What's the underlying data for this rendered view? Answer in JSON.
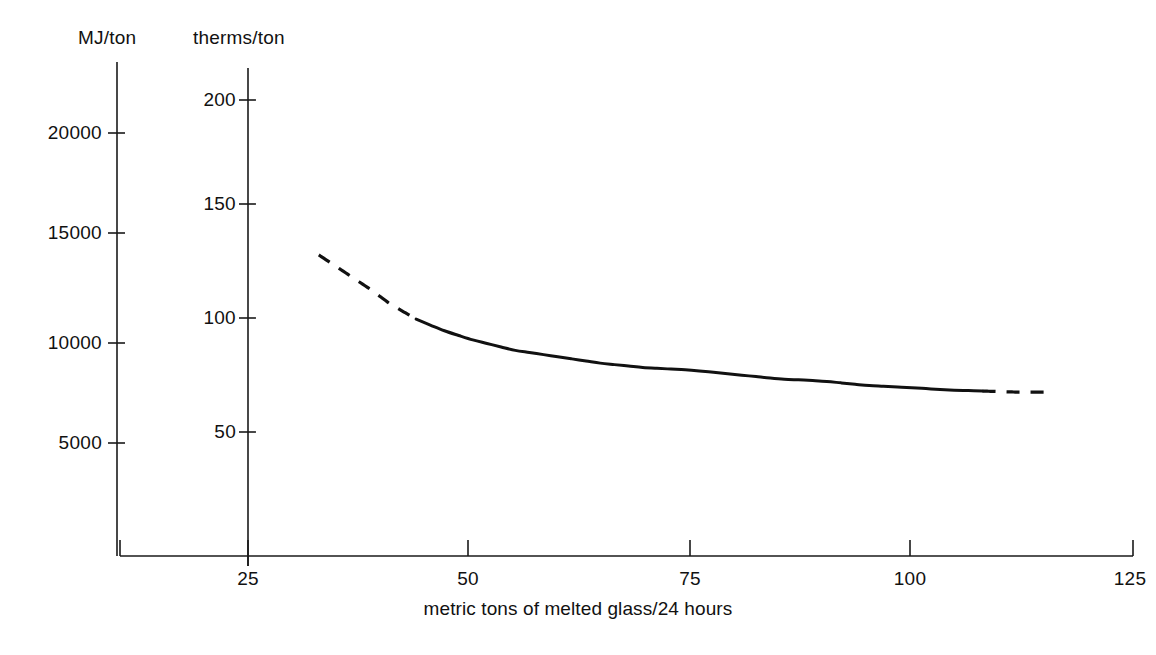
{
  "chart_data": {
    "type": "line",
    "title": "",
    "xlabel": "metric tons of melted glass/24 hours",
    "ylabel": "MJ/ton",
    "ylabel_secondary": "therms/ton",
    "xlim": [
      12.5,
      125
    ],
    "ylim_primary": [
      0,
      21500
    ],
    "ylim_secondary": [
      0,
      213
    ],
    "grid": false,
    "legend": false,
    "x_ticks": [
      25,
      50,
      75,
      100,
      125
    ],
    "y_ticks_primary": [
      5000,
      10000,
      15000,
      20000
    ],
    "y_ticks_primary_labels": [
      "5000",
      "10000",
      "15000",
      "20000"
    ],
    "y_ticks_secondary": [
      50,
      100,
      150,
      200
    ],
    "y_ticks_secondary_labels": [
      "50",
      "100",
      "150",
      "200"
    ],
    "series": [
      {
        "name": "specific energy consumption",
        "x": [
          33,
          36,
          39,
          41,
          44,
          47,
          50,
          55,
          60,
          65,
          70,
          75,
          80,
          85,
          90,
          95,
          100,
          104,
          108,
          112,
          115
        ],
        "values": [
          130,
          122,
          114,
          108,
          101,
          96,
          92,
          87,
          84,
          81,
          79,
          78,
          76,
          74,
          73,
          71,
          70,
          69,
          68.5,
          68,
          68
        ],
        "units": "therms/ton",
        "segments": [
          {
            "style": "dashed",
            "x_from": 33,
            "x_to": 44
          },
          {
            "style": "solid",
            "x_from": 44,
            "x_to": 108
          },
          {
            "style": "dashed",
            "x_from": 108,
            "x_to": 115
          }
        ]
      }
    ],
    "annotations": []
  },
  "axes": {
    "primary_title": "MJ/ton",
    "secondary_title": "therms/ton",
    "x_title": "metric tons of melted glass/24 hours"
  },
  "ticks": {
    "primary": [
      {
        "label": "20000",
        "value": 20000
      },
      {
        "label": "15000",
        "value": 15000
      },
      {
        "label": "10000",
        "value": 10000
      },
      {
        "label": "5000",
        "value": 5000
      }
    ],
    "secondary": [
      {
        "label": "200",
        "value": 200
      },
      {
        "label": "150",
        "value": 150
      },
      {
        "label": "100",
        "value": 100
      },
      {
        "label": "50",
        "value": 50
      }
    ],
    "x": [
      {
        "label": "25",
        "value": 25
      },
      {
        "label": "50",
        "value": 50
      },
      {
        "label": "75",
        "value": 75
      },
      {
        "label": "100",
        "value": 100
      },
      {
        "label": "125",
        "value": 125
      }
    ]
  }
}
